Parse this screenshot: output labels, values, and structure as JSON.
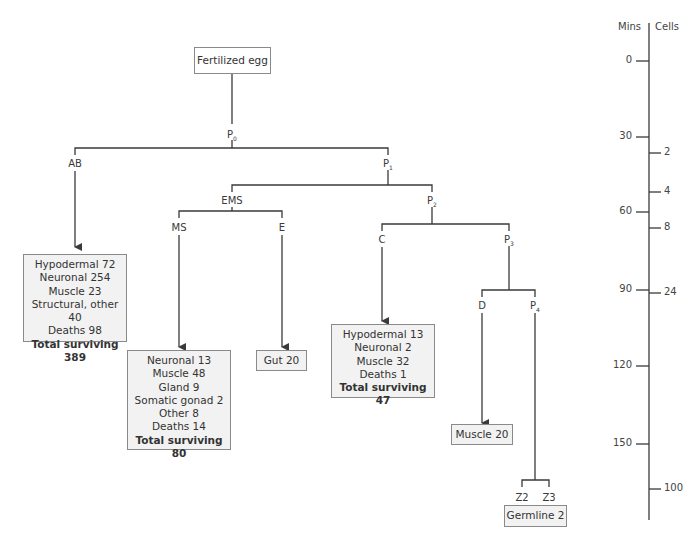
{
  "diagram": {
    "root": "Fertilized egg",
    "nodes": {
      "P0": {
        "base": "P",
        "sub": "0"
      },
      "AB": {
        "base": "AB",
        "sub": ""
      },
      "P1": {
        "base": "P",
        "sub": "1"
      },
      "EMS": {
        "base": "EMS",
        "sub": ""
      },
      "P2": {
        "base": "P",
        "sub": "2"
      },
      "MS": {
        "base": "MS",
        "sub": ""
      },
      "E": {
        "base": "E",
        "sub": ""
      },
      "C": {
        "base": "C",
        "sub": ""
      },
      "P3": {
        "base": "P",
        "sub": "3"
      },
      "D": {
        "base": "D",
        "sub": ""
      },
      "P4": {
        "base": "P",
        "sub": "4"
      },
      "Z2": {
        "base": "Z2",
        "sub": ""
      },
      "Z3": {
        "base": "Z3",
        "sub": ""
      }
    },
    "fates": {
      "AB": {
        "lines": [
          "Hypodermal 72",
          "Neuronal 254",
          "Muscle 23",
          "Structural, other 40",
          "Deaths 98"
        ],
        "total": "Total surviving 389"
      },
      "MS": {
        "lines": [
          "Neuronal 13",
          "Muscle 48",
          "Gland 9",
          "Somatic gonad 2",
          "Other 8",
          "Deaths 14"
        ],
        "total": "Total surviving 80"
      },
      "E": {
        "lines": [
          "Gut 20"
        ],
        "total": ""
      },
      "C": {
        "lines": [
          "Hypodermal 13",
          "Neuronal 2",
          "Muscle 32",
          "Deaths 1"
        ],
        "total": "Total surviving 47"
      },
      "D": {
        "lines": [
          "Muscle 20"
        ],
        "total": ""
      },
      "Z": {
        "lines": [
          "Germline 2"
        ],
        "total": ""
      }
    }
  },
  "timeline": {
    "mins_label": "Mins",
    "cells_label": "Cells",
    "mins_ticks": [
      {
        "label": "0",
        "y": 61
      },
      {
        "label": "30",
        "y": 137
      },
      {
        "label": "60",
        "y": 212
      },
      {
        "label": "90",
        "y": 290
      },
      {
        "label": "120",
        "y": 366
      },
      {
        "label": "150",
        "y": 444
      }
    ],
    "cells_ticks": [
      {
        "label": "2",
        "y": 153
      },
      {
        "label": "4",
        "y": 192
      },
      {
        "label": "8",
        "y": 228
      },
      {
        "label": "24",
        "y": 293
      },
      {
        "label": "100",
        "y": 489
      }
    ]
  },
  "colors": {
    "line": "#3a3a3a",
    "box_fill": "#f2f2f2",
    "box_border": "#8a8a8a"
  }
}
